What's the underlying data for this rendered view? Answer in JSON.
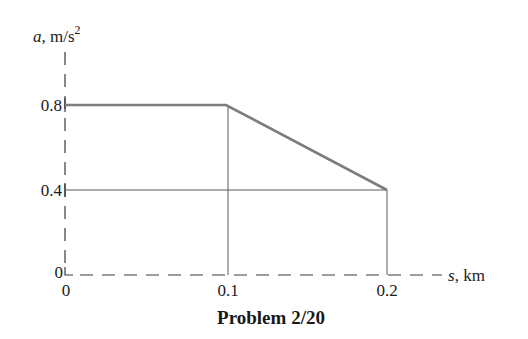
{
  "figure": {
    "title": "Problem 2/20",
    "y_axis": {
      "var": "a",
      "unit": ", m/s",
      "exp": "2"
    },
    "x_axis": {
      "var": "s",
      "unit": ", km"
    },
    "y_ticks": [
      "0.8",
      "0.4",
      "0"
    ],
    "x_ticks": [
      "0",
      "0.1",
      "0.2"
    ]
  },
  "colors": {
    "data_line": "#7d7d7d",
    "grid_line": "#5a5a5a",
    "axis": "#3a3a3a",
    "text": "#1a1a1a"
  },
  "chart_data": {
    "type": "line",
    "title": "Problem 2/20",
    "xlabel": "s, km",
    "ylabel": "a, m/s^2",
    "x": [
      0,
      0.1,
      0.2
    ],
    "series": [
      {
        "name": "a(s)",
        "values": [
          0.8,
          0.8,
          0.4
        ]
      }
    ],
    "xticks": [
      0,
      0.1,
      0.2
    ],
    "yticks": [
      0,
      0.4,
      0.8
    ],
    "xlim": [
      0,
      0.2
    ],
    "ylim": [
      0,
      0.8
    ],
    "grid": false,
    "reference_lines": {
      "vertical": [
        0.1,
        0.2
      ],
      "horizontal": [
        0.4
      ]
    },
    "axis_style": "dashed",
    "legend": null
  }
}
